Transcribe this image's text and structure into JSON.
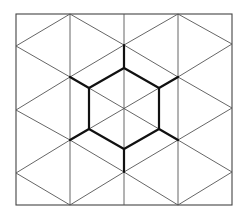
{
  "diagram": {
    "title": "",
    "colors": {
      "background": "#ffffff",
      "thin_line": "#555555",
      "border_line": "#444444",
      "bold_line": "#111111"
    },
    "border": {
      "x1": 16,
      "y1": 14,
      "x2": 232,
      "y2": 205
    },
    "verticals": [
      70,
      124,
      178
    ],
    "thin_segments": [
      [
        16,
        46,
        70,
        14
      ],
      [
        70,
        14,
        124,
        45
      ],
      [
        124,
        45,
        178,
        14
      ],
      [
        178,
        14,
        232,
        44
      ],
      [
        16,
        46,
        70,
        77
      ],
      [
        70,
        77,
        124,
        45
      ],
      [
        124,
        45,
        178,
        77
      ],
      [
        178,
        77,
        232,
        44
      ],
      [
        16,
        110,
        70,
        77
      ],
      [
        178,
        77,
        232,
        108
      ],
      [
        16,
        110,
        70,
        140
      ],
      [
        178,
        140,
        232,
        108
      ],
      [
        16,
        173,
        70,
        140
      ],
      [
        70,
        140,
        124,
        172
      ],
      [
        124,
        172,
        178,
        140
      ],
      [
        178,
        140,
        232,
        172
      ],
      [
        16,
        173,
        70,
        205
      ],
      [
        70,
        205,
        124,
        172
      ],
      [
        124,
        172,
        178,
        205
      ],
      [
        178,
        205,
        232,
        172
      ],
      [
        89,
        88,
        159,
        129
      ],
      [
        159,
        88,
        89,
        129
      ],
      [
        70,
        77,
        89,
        88
      ],
      [
        178,
        77,
        159,
        88
      ],
      [
        70,
        140,
        89,
        129
      ],
      [
        178,
        140,
        159,
        129
      ]
    ],
    "hexagon": {
      "center": [
        124,
        108
      ],
      "vertices": [
        [
          124,
          68
        ],
        [
          159,
          88
        ],
        [
          159,
          129
        ],
        [
          124,
          149
        ],
        [
          89,
          129
        ],
        [
          89,
          88
        ]
      ]
    },
    "spokes": [
      [
        124,
        68,
        124,
        45
      ],
      [
        159,
        88,
        178,
        77
      ],
      [
        159,
        129,
        178,
        140
      ],
      [
        124,
        149,
        124,
        172
      ],
      [
        89,
        129,
        70,
        140
      ],
      [
        89,
        88,
        70,
        77
      ]
    ],
    "labels": []
  }
}
